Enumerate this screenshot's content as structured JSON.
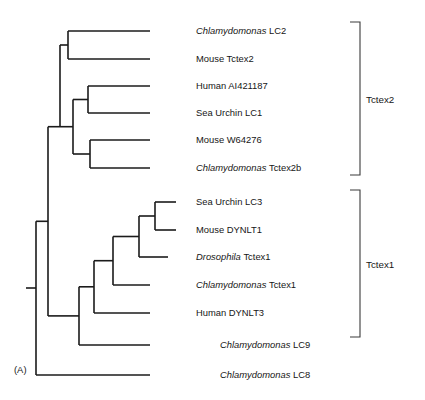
{
  "figure": {
    "panel_label": "(A)",
    "width": 425,
    "height": 400,
    "background": "#ffffff",
    "line_color": "#1b1b1b",
    "bracket_color": "#3a3a3a",
    "text_color": "#161616"
  },
  "chart_data": {
    "type": "tree",
    "title": "",
    "subtitle": "",
    "xlabel": "",
    "ylabel": "",
    "grid": false,
    "legend_position": "right",
    "orientation": "left-to-right-cladogram",
    "taxa": [
      {
        "id": "lc2",
        "genus": "Chlamydomonas",
        "gene": "LC2",
        "label": "Chlamydomonas LC2",
        "italic_genus": true,
        "y": 31,
        "tip_x": 150,
        "clade": "Tctex2"
      },
      {
        "id": "mtctex2",
        "genus": "",
        "gene": "Mouse Tctex2",
        "label": "Mouse Tctex2",
        "italic_genus": false,
        "y": 59,
        "tip_x": 150,
        "clade": "Tctex2"
      },
      {
        "id": "ai421187",
        "genus": "",
        "gene": "Human AI421187",
        "label": "Human AI421187",
        "italic_genus": false,
        "y": 86,
        "tip_x": 150,
        "clade": "Tctex2"
      },
      {
        "id": "lc1",
        "genus": "",
        "gene": "Sea Urchin LC1",
        "label": "Sea Urchin LC1",
        "italic_genus": false,
        "y": 113,
        "tip_x": 150,
        "clade": "Tctex2"
      },
      {
        "id": "w64276",
        "genus": "",
        "gene": "Mouse W64276",
        "label": "Mouse W64276",
        "italic_genus": false,
        "y": 140,
        "tip_x": 150,
        "clade": "Tctex2"
      },
      {
        "id": "tctex2b",
        "genus": "Chlamydomonas",
        "gene": "Tctex2b",
        "label": "Chlamydomonas Tctex2b",
        "italic_genus": true,
        "y": 168,
        "tip_x": 150,
        "clade": "Tctex2"
      },
      {
        "id": "lc3",
        "genus": "",
        "gene": "Sea Urchin LC3",
        "label": "Sea Urchin LC3",
        "italic_genus": false,
        "y": 202,
        "tip_x": 176,
        "clade": "Tctex1"
      },
      {
        "id": "dynlt1",
        "genus": "",
        "gene": "Mouse DYNLT1",
        "label": "Mouse DYNLT1",
        "italic_genus": false,
        "y": 230,
        "tip_x": 176,
        "clade": "Tctex1"
      },
      {
        "id": "dtctex1",
        "genus": "Drosophila",
        "gene": "Tctex1",
        "label": "Drosophila Tctex1",
        "italic_genus": true,
        "y": 257,
        "tip_x": 168,
        "clade": "Tctex1"
      },
      {
        "id": "ctctex1",
        "genus": "Chlamydomonas",
        "gene": "Tctex1",
        "label": "Chlamydomonas Tctex1",
        "italic_genus": true,
        "y": 285,
        "tip_x": 150,
        "clade": "Tctex1"
      },
      {
        "id": "dynlt3",
        "genus": "",
        "gene": "Human DYNLT3",
        "label": "Human DYNLT3",
        "italic_genus": false,
        "y": 313,
        "tip_x": 150,
        "clade": "Tctex1"
      },
      {
        "id": "lc9",
        "genus": "Chlamydomonas",
        "gene": "LC9",
        "label": "Chlamydomonas LC9",
        "italic_genus": true,
        "y": 345,
        "tip_x": 150,
        "clade": ""
      },
      {
        "id": "lc8",
        "genus": "Chlamydomonas",
        "gene": "LC8",
        "label": "Chlamydomonas LC8",
        "italic_genus": true,
        "y": 375,
        "tip_x": 150,
        "clade": ""
      }
    ],
    "label_x": 196,
    "label_x_offsets": {
      "lc2": 196,
      "mtctex2": 196,
      "ai421187": 196,
      "lc1": 196,
      "w64276": 196,
      "tctex2b": 196,
      "lc3": 196,
      "dynlt1": 196,
      "dtctex1": 196,
      "ctctex1": 196,
      "dynlt3": 196,
      "lc9": 220,
      "lc8": 220
    },
    "nodes": [
      {
        "id": "n_lc2_mtctex2",
        "x": 68,
        "children_y": [
          31,
          59
        ],
        "note": "Chlamydomonas LC2 + Mouse Tctex2"
      },
      {
        "id": "n_ai_lc1",
        "x": 88,
        "children_y": [
          86,
          113
        ],
        "note": "Human AI421187 + Sea Urchin LC1"
      },
      {
        "id": "n_w64_tctex2b",
        "x": 90,
        "children_y": [
          140,
          168
        ],
        "note": "Mouse W64276 + Chlamydomonas Tctex2b"
      },
      {
        "id": "n_tctex2_inner",
        "x": 73,
        "children_y": [
          99.5,
          154
        ],
        "note": "inner Tctex2 grouping"
      },
      {
        "id": "n_tctex2_root",
        "x": 60,
        "children_y": [
          45,
          126.7
        ],
        "note": "Tctex2 clade root"
      },
      {
        "id": "n_lc3_dynlt1",
        "x": 155,
        "children_y": [
          202,
          230
        ],
        "note": "Sea Urchin LC3 + Mouse DYNLT1"
      },
      {
        "id": "n_plus_dros",
        "x": 139,
        "children_y": [
          216,
          257
        ],
        "note": "+ Drosophila Tctex1"
      },
      {
        "id": "n_plus_chlamy",
        "x": 113,
        "children_y": [
          236.5,
          285
        ],
        "note": "+ Chlamydomonas Tctex1"
      },
      {
        "id": "n_plus_dynlt3",
        "x": 94,
        "children_y": [
          260.7,
          313
        ],
        "note": "+ Human DYNLT3"
      },
      {
        "id": "n_plus_lc9",
        "x": 79,
        "children_y": [
          286.8,
          345
        ],
        "note": "+ Chlamydomonas LC9"
      },
      {
        "id": "n_tctex1_root",
        "x": 48,
        "children_y": [
          126.7,
          315.9
        ],
        "note": "Tctex1 clade root joining Tctex2"
      },
      {
        "id": "n_root",
        "x": 36,
        "children_y": [
          221.3,
          375
        ],
        "note": "overall root with Chlamydomonas LC8 outgroup"
      }
    ],
    "root_stub": {
      "x1": 26,
      "x2": 36,
      "y": 288
    },
    "brackets": [
      {
        "id": "bracket-tctex2",
        "label": "Tctex2",
        "x": 360,
        "y_top": 22,
        "y_bottom": 175,
        "tick": 10,
        "label_x": 366,
        "label_y": 100
      },
      {
        "id": "bracket-tctex1",
        "label": "Tctex1",
        "x": 360,
        "y_top": 190,
        "y_bottom": 337,
        "tick": 10,
        "label_x": 366,
        "label_y": 265
      }
    ]
  }
}
